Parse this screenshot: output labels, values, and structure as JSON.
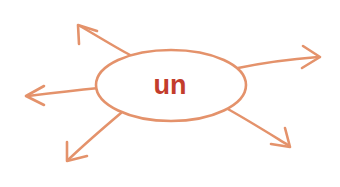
{
  "canvas": {
    "width": 340,
    "height": 187,
    "background_color": "#ffffff"
  },
  "diagram": {
    "type": "radial-mind-map",
    "title": "un",
    "accent_color": "#e4926b",
    "label_color": "#c33d2c",
    "node": {
      "label": "un",
      "shape": "ellipse",
      "center_x": 171,
      "center_y": 85,
      "radius_x": 75,
      "radius_y": 35,
      "stroke_color": "#e4926b",
      "fill_color": "#ffffff",
      "label_font_size": 27
    },
    "branch_count": 5,
    "branches": [
      {
        "name": "branch-up-left",
        "direction": "up-left",
        "start_x": 118,
        "start_y": 59,
        "tip_x": 78,
        "tip_y": 25,
        "stroke_color": "#e4926b"
      },
      {
        "name": "branch-right",
        "direction": "right",
        "start_x": 240,
        "start_y": 69,
        "tip_x": 320,
        "tip_y": 57,
        "stroke_color": "#e4926b"
      },
      {
        "name": "branch-left",
        "direction": "left",
        "start_x": 97,
        "start_y": 89,
        "tip_x": 26,
        "tip_y": 96,
        "stroke_color": "#e4926b"
      },
      {
        "name": "branch-down-left",
        "direction": "down-left",
        "start_x": 117,
        "start_y": 111,
        "tip_x": 67,
        "tip_y": 161,
        "stroke_color": "#e4926b"
      },
      {
        "name": "branch-down-right",
        "direction": "down-right",
        "start_x": 228,
        "start_y": 110,
        "tip_x": 290,
        "tip_y": 147,
        "stroke_color": "#e4926b"
      }
    ]
  }
}
